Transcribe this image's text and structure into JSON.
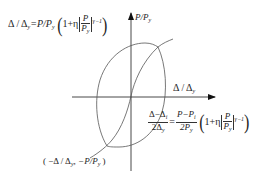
{
  "diagram": {
    "axes": {
      "x_label": "Δ / Δy",
      "y_label": "P/Py",
      "x_label_parts": {
        "main": "Δ / Δ",
        "sub": "y"
      },
      "y_label_parts": {
        "main": "P/P",
        "sub": "y"
      }
    },
    "skeleton_equation": {
      "lhs": "Δ / Δ",
      "lhs_sub": "y",
      "rhs_prefix": "=P/P",
      "rhs_prefix_sub": "y",
      "one_plus_eta": "1+η",
      "frac_num": "P",
      "frac_den": "P",
      "frac_den_sub": "y",
      "exponent": "γ−1",
      "full": "Δ/Δy = P/Py (1+η|P/Py|^(γ−1))"
    },
    "branch_equation": {
      "lhs_num": "Δ−Δ",
      "lhs_num_sub": "i",
      "lhs_den": "2Δ",
      "lhs_den_sub": "y",
      "rhs_num": "P−P",
      "rhs_num_sub": "i",
      "rhs_den": "2P",
      "rhs_den_sub": "y",
      "one_plus_eta": "1+η",
      "frac_num": "P",
      "frac_den": "P",
      "frac_den_sub": "y",
      "exponent": "γ−1",
      "full": "(Δ−Δi)/(2Δy) = (P−Pi)/(2Py) (1+η|P/Py|^(γ−1))"
    },
    "corner_point_label": "( −Δ / Δy,  −P/Py )",
    "corner_parts": {
      "open": "( −Δ / Δ",
      "sub1": "y",
      "mid": ",  −P/P",
      "sub2": "y",
      "close": " )"
    },
    "colors": {
      "line": "#333333",
      "curve": "#555555",
      "background": "#ffffff"
    }
  }
}
